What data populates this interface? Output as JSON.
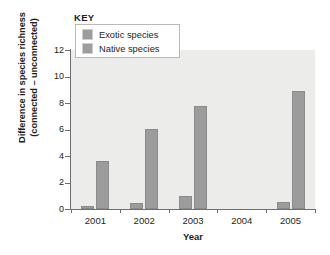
{
  "chart_data": {
    "type": "bar",
    "title": "",
    "xlabel": "Year",
    "ylabel": "Difference in species richness (connected – unconnected)",
    "ylabel_line1": "Difference in species richness",
    "ylabel_line2": "(connected – unconnected)",
    "categories": [
      "2001",
      "2002",
      "2003",
      "2004",
      "2005"
    ],
    "series": [
      {
        "name": "Exotic species",
        "values": [
          0.2,
          0.45,
          1.0,
          0,
          0.5
        ]
      },
      {
        "name": "Native species",
        "values": [
          3.65,
          6.05,
          7.8,
          0,
          8.9
        ]
      }
    ],
    "ylim": [
      0,
      12
    ],
    "yticks": [
      "0",
      "2",
      "4",
      "6",
      "8",
      "10",
      "12"
    ],
    "ytick_values": [
      0,
      2,
      4,
      6,
      8,
      10,
      12
    ],
    "grid": false,
    "legend_position": "top-left",
    "legend_title": "KEY",
    "bar_color": "#9c9c9c",
    "panel_color": "#ececeb",
    "axis_color": "#6e6e6e"
  },
  "legend": {
    "title": "KEY",
    "items": [
      {
        "label": "Exotic species",
        "color": "#9c9c9c"
      },
      {
        "label": "Native species",
        "color": "#9c9c9c"
      }
    ]
  }
}
